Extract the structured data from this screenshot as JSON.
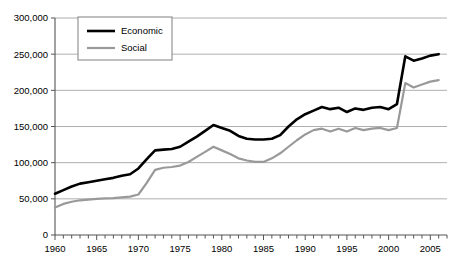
{
  "chart_data": {
    "type": "line",
    "title": "",
    "subtitle": "",
    "xlabel": "",
    "ylabel": "",
    "xlim": [
      1960,
      2007
    ],
    "ylim": [
      0,
      300000
    ],
    "y_ticks": [
      0,
      50000,
      100000,
      150000,
      200000,
      250000,
      300000
    ],
    "y_tick_labels": [
      "0",
      "50,000",
      "100,000",
      "150,000",
      "200,000",
      "250,000",
      "300,000"
    ],
    "x_ticks": [
      1960,
      1965,
      1970,
      1975,
      1980,
      1985,
      1990,
      1995,
      2000,
      2005
    ],
    "x_tick_labels": [
      "1960",
      "1965",
      "1970",
      "1975",
      "1980",
      "1985",
      "1990",
      "1995",
      "2000",
      "2005"
    ],
    "x_minor_tick_interval": 1,
    "grid": "horizontal",
    "legend": {
      "position": "top-left-inside",
      "entries": [
        {
          "name": "Economic",
          "color": "#000000",
          "width": 2.6
        },
        {
          "name": "Social",
          "color": "#999999",
          "width": 2.2
        }
      ]
    },
    "x": [
      1960,
      1961,
      1962,
      1963,
      1964,
      1965,
      1966,
      1967,
      1968,
      1969,
      1970,
      1971,
      1972,
      1973,
      1974,
      1975,
      1976,
      1977,
      1978,
      1979,
      1980,
      1981,
      1982,
      1983,
      1984,
      1985,
      1986,
      1987,
      1988,
      1989,
      1990,
      1991,
      1992,
      1993,
      1994,
      1995,
      1996,
      1997,
      1998,
      1999,
      2000,
      2001,
      2002,
      2003,
      2004,
      2005,
      2006
    ],
    "series": [
      {
        "name": "Economic",
        "color": "#000000",
        "values": [
          57000,
          62000,
          67000,
          71000,
          73000,
          75000,
          77000,
          79000,
          82000,
          84000,
          92000,
          105000,
          117000,
          118000,
          119000,
          122000,
          129000,
          136000,
          144000,
          152000,
          148000,
          144000,
          137000,
          133000,
          132000,
          132000,
          133000,
          138000,
          150000,
          160000,
          167000,
          172000,
          177000,
          174000,
          176000,
          170000,
          175000,
          173000,
          176000,
          177000,
          174000,
          181000,
          247000,
          241000,
          244000,
          248000,
          250000
        ]
      },
      {
        "name": "Social",
        "color": "#999999",
        "values": [
          38000,
          43000,
          46000,
          48000,
          49000,
          50000,
          50500,
          51000,
          52000,
          53000,
          56000,
          72000,
          90000,
          93000,
          94000,
          96000,
          101000,
          108000,
          115000,
          122000,
          117000,
          112000,
          106000,
          103000,
          101000,
          101000,
          106000,
          113000,
          122000,
          131000,
          139000,
          145000,
          147000,
          143000,
          147000,
          143000,
          148000,
          145000,
          147000,
          148000,
          145000,
          148000,
          210000,
          204000,
          208000,
          212000,
          214000
        ]
      }
    ]
  }
}
